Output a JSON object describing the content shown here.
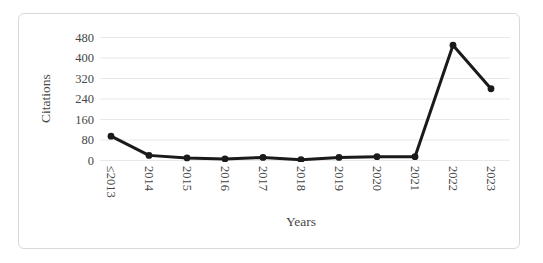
{
  "chart_data": {
    "type": "line",
    "title": "",
    "xlabel": "Years",
    "ylabel": "Citations",
    "categories": [
      "≤2013",
      "2014",
      "2015",
      "2016",
      "2017",
      "2018",
      "2019",
      "2020",
      "2021",
      "2022",
      "2023"
    ],
    "values": [
      95,
      20,
      10,
      6,
      12,
      3,
      12,
      15,
      15,
      450,
      280
    ],
    "ylim": [
      0,
      480
    ],
    "yticks": [
      0,
      80,
      160,
      240,
      320,
      400,
      480
    ],
    "grid": "horizontal",
    "legend": "none",
    "marker": "circle"
  },
  "style": {
    "line_color": "#1a1a1a",
    "marker_color": "#1a1a1a",
    "grid_color": "#e8e8e8",
    "text_color": "#474747",
    "frame_border_color": "#d9d9d9",
    "background": "#ffffff"
  }
}
